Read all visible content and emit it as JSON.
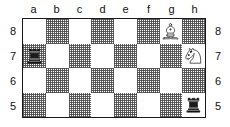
{
  "board": {
    "file_labels": [
      "a",
      "b",
      "c",
      "d",
      "e",
      "f",
      "g",
      "h"
    ],
    "rank_labels": [
      "8",
      "7",
      "6",
      "5"
    ],
    "light_square_color": "#ffffff",
    "dark_square_color": "#808080",
    "border_color": "#1a1a1a",
    "label_color": "#111111",
    "ranks": [
      {
        "rank": "8",
        "squares": [
          {
            "id": "a8",
            "shade": "light",
            "piece": null
          },
          {
            "id": "b8",
            "shade": "dark",
            "piece": null
          },
          {
            "id": "c8",
            "shade": "light",
            "piece": null
          },
          {
            "id": "d8",
            "shade": "dark",
            "piece": null
          },
          {
            "id": "e8",
            "shade": "light",
            "piece": null
          },
          {
            "id": "f8",
            "shade": "dark",
            "piece": null
          },
          {
            "id": "g8",
            "shade": "light",
            "piece": "white-bishop"
          },
          {
            "id": "h8",
            "shade": "dark",
            "piece": null
          }
        ]
      },
      {
        "rank": "7",
        "squares": [
          {
            "id": "a7",
            "shade": "dark",
            "piece": "black-rook"
          },
          {
            "id": "b7",
            "shade": "light",
            "piece": null
          },
          {
            "id": "c7",
            "shade": "dark",
            "piece": null
          },
          {
            "id": "d7",
            "shade": "light",
            "piece": null
          },
          {
            "id": "e7",
            "shade": "dark",
            "piece": null
          },
          {
            "id": "f7",
            "shade": "light",
            "piece": null
          },
          {
            "id": "g7",
            "shade": "dark",
            "piece": null
          },
          {
            "id": "h7",
            "shade": "light",
            "piece": "white-knight"
          }
        ]
      },
      {
        "rank": "6",
        "squares": [
          {
            "id": "a6",
            "shade": "light",
            "piece": null
          },
          {
            "id": "b6",
            "shade": "dark",
            "piece": null
          },
          {
            "id": "c6",
            "shade": "light",
            "piece": null
          },
          {
            "id": "d6",
            "shade": "dark",
            "piece": null
          },
          {
            "id": "e6",
            "shade": "light",
            "piece": null
          },
          {
            "id": "f6",
            "shade": "dark",
            "piece": null
          },
          {
            "id": "g6",
            "shade": "light",
            "piece": null
          },
          {
            "id": "h6",
            "shade": "dark",
            "piece": null
          }
        ]
      },
      {
        "rank": "5",
        "squares": [
          {
            "id": "a5",
            "shade": "dark",
            "piece": null
          },
          {
            "id": "b5",
            "shade": "light",
            "piece": null
          },
          {
            "id": "c5",
            "shade": "dark",
            "piece": null
          },
          {
            "id": "d5",
            "shade": "light",
            "piece": null
          },
          {
            "id": "e5",
            "shade": "dark",
            "piece": null
          },
          {
            "id": "f5",
            "shade": "light",
            "piece": null
          },
          {
            "id": "g5",
            "shade": "dark",
            "piece": null
          },
          {
            "id": "h5",
            "shade": "light",
            "piece": "black-rook"
          }
        ]
      }
    ]
  }
}
